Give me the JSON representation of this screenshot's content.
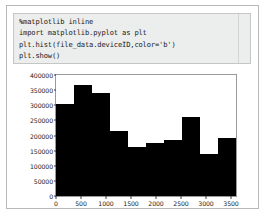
{
  "notebook": {
    "cell": {
      "lines": [
        "%matplotlib inline",
        "import matplotlib.pyplot as plt",
        "plt.hist(file_data.deviceID,color='b')",
        "plt.show()"
      ]
    }
  },
  "chart_data": {
    "type": "bar",
    "title": "",
    "xlabel": "",
    "ylabel": "",
    "grid": false,
    "legend": null,
    "bar_color": "#000000",
    "background_color": "#ffffff",
    "xlim": [
      0,
      3600
    ],
    "ylim": [
      0,
      400000
    ],
    "xticks": [
      0,
      500,
      1000,
      1500,
      2000,
      2500,
      3000,
      3500
    ],
    "xtick_labels": [
      "0",
      "500",
      "1000",
      "1500",
      "2000",
      "2500",
      "3000",
      "3500"
    ],
    "yticks": [
      0,
      50000,
      100000,
      150000,
      200000,
      250000,
      300000,
      350000,
      400000
    ],
    "ytick_labels": [
      "0",
      "50000",
      "100000",
      "150000",
      "200000",
      "250000",
      "300000",
      "350000",
      "400000"
    ],
    "bin_edges": [
      0,
      360,
      720,
      1080,
      1440,
      1800,
      2160,
      2520,
      2880,
      3240,
      3600
    ],
    "categories": [
      "0-360",
      "360-720",
      "720-1080",
      "1080-1440",
      "1440-1800",
      "1800-2160",
      "2160-2520",
      "2520-2880",
      "2880-3240",
      "3240-3600"
    ],
    "values": [
      304000,
      367000,
      340000,
      215000,
      162000,
      175000,
      185000,
      261000,
      139000,
      192000
    ]
  }
}
